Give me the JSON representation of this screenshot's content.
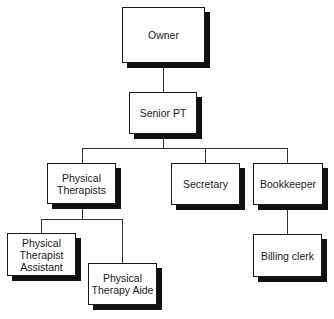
{
  "chart": {
    "type": "org-chart",
    "colors": {
      "box_fill": "#ffffff",
      "border": "#1a1a1a",
      "shadow": "#111111",
      "line": "#333333"
    },
    "nodes": {
      "owner": {
        "label": "Owner"
      },
      "senior_pt": {
        "label": "Senior PT"
      },
      "physical_therapists": {
        "label": "Physical\nTherapists"
      },
      "secretary": {
        "label": "Secretary"
      },
      "bookkeeper": {
        "label": "Bookkeeper"
      },
      "pt_assistant": {
        "label": "Physical\nTherapist\nAssistant"
      },
      "pt_aide": {
        "label": "Physical\nTherapy Aide"
      },
      "billing_clerk": {
        "label": "Billing clerk"
      }
    },
    "edges": [
      [
        "owner",
        "senior_pt"
      ],
      [
        "senior_pt",
        "physical_therapists"
      ],
      [
        "senior_pt",
        "secretary"
      ],
      [
        "senior_pt",
        "bookkeeper"
      ],
      [
        "physical_therapists",
        "pt_assistant"
      ],
      [
        "physical_therapists",
        "pt_aide"
      ],
      [
        "bookkeeper",
        "billing_clerk"
      ]
    ]
  }
}
